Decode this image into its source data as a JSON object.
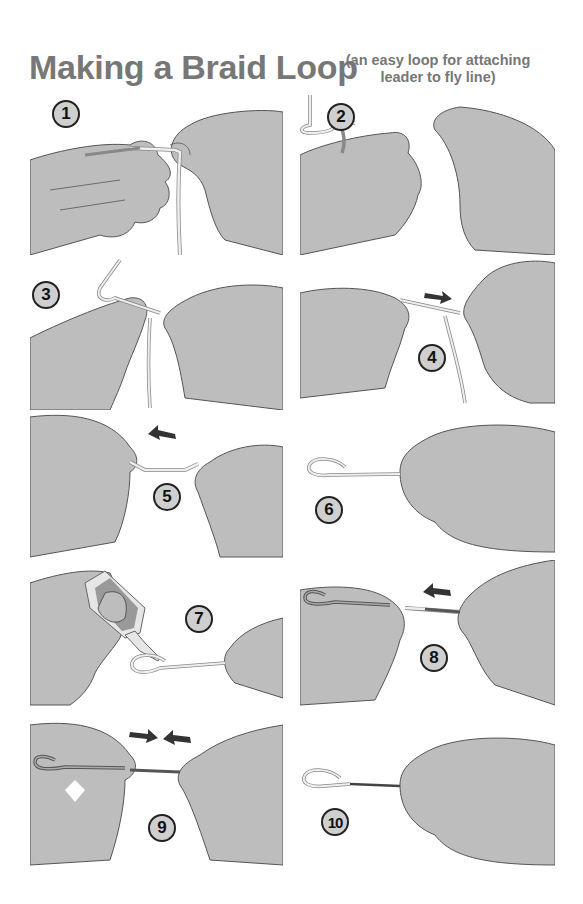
{
  "title": "Making a Braid Loop",
  "subtitle_line1": "(an easy loop for attaching",
  "subtitle_line2": "leader to fly line)",
  "colors": {
    "title_text": "#777777",
    "hand_fill": "#bdbdbd",
    "hand_outline": "#555555",
    "line_fill": "#eeeeee",
    "badge_fill": "#cfcfcf",
    "badge_border": "#222222",
    "arrow": "#333333",
    "leader_dark": "#555555"
  },
  "steps": [
    {
      "number": "1",
      "arrows": []
    },
    {
      "number": "2",
      "arrows": []
    },
    {
      "number": "3",
      "arrows": []
    },
    {
      "number": "4",
      "arrows": [
        "right"
      ]
    },
    {
      "number": "5",
      "arrows": [
        "left"
      ]
    },
    {
      "number": "6",
      "arrows": []
    },
    {
      "number": "7",
      "arrows": [],
      "tool": "glue-bottle"
    },
    {
      "number": "8",
      "arrows": [
        "left"
      ]
    },
    {
      "number": "9",
      "arrows": [
        "right",
        "left"
      ]
    },
    {
      "number": "10",
      "arrows": []
    }
  ]
}
